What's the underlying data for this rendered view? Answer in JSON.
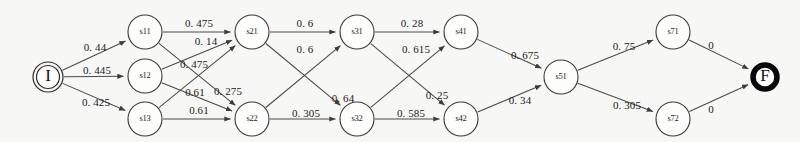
{
  "diagram": {
    "background_color": "#f7f7f5",
    "stroke_color": "#4a4a4a",
    "start_node": {
      "id": "I",
      "label": "I",
      "x": 48,
      "y": 77,
      "r": 15
    },
    "final_node": {
      "id": "F",
      "label": "F",
      "x": 765,
      "y": 77,
      "r": 14
    },
    "nodes": [
      {
        "id": "s11",
        "label": "s11",
        "x": 145,
        "y": 32,
        "r": 17
      },
      {
        "id": "s12",
        "label": "s12",
        "x": 145,
        "y": 76,
        "r": 17
      },
      {
        "id": "s13",
        "label": "s13",
        "x": 145,
        "y": 119,
        "r": 17
      },
      {
        "id": "s21",
        "label": "s21",
        "x": 252,
        "y": 32,
        "r": 17
      },
      {
        "id": "s22",
        "label": "s22",
        "x": 252,
        "y": 119,
        "r": 17
      },
      {
        "id": "s31",
        "label": "s31",
        "x": 357,
        "y": 32,
        "r": 17
      },
      {
        "id": "s32",
        "label": "s32",
        "x": 357,
        "y": 119,
        "r": 17
      },
      {
        "id": "s41",
        "label": "s41",
        "x": 461,
        "y": 32,
        "r": 17
      },
      {
        "id": "s42",
        "label": "s42",
        "x": 461,
        "y": 119,
        "r": 17
      },
      {
        "id": "s51",
        "label": "s51",
        "x": 561,
        "y": 77,
        "r": 17
      },
      {
        "id": "s71",
        "label": "s71",
        "x": 673,
        "y": 32,
        "r": 17
      },
      {
        "id": "s72",
        "label": "s72",
        "x": 673,
        "y": 119,
        "r": 17
      }
    ],
    "edges": [
      {
        "from": "I",
        "to": "s11",
        "weight": "0. 44",
        "lx": 95,
        "ly": 48
      },
      {
        "from": "I",
        "to": "s12",
        "weight": "0. 445",
        "lx": 97,
        "ly": 71
      },
      {
        "from": "I",
        "to": "s13",
        "weight": "0. 425",
        "lx": 96,
        "ly": 103
      },
      {
        "from": "s11",
        "to": "s21",
        "weight": "0. 475",
        "lx": 199,
        "ly": 24
      },
      {
        "from": "s11",
        "to": "s22",
        "weight": "0. 475",
        "lx": 194,
        "ly": 65
      },
      {
        "from": "s12",
        "to": "s21",
        "weight": "0. 14",
        "lx": 206,
        "ly": 42
      },
      {
        "from": "s12",
        "to": "s22",
        "weight": "0.61",
        "lx": 195,
        "ly": 93
      },
      {
        "from": "s13",
        "to": "s21",
        "weight": "0. 275",
        "lx": 228,
        "ly": 92
      },
      {
        "from": "s13",
        "to": "s22",
        "weight": "0.61",
        "lx": 199,
        "ly": 111
      },
      {
        "from": "s21",
        "to": "s31",
        "weight": "0. 6",
        "lx": 305,
        "ly": 24
      },
      {
        "from": "s21",
        "to": "s32",
        "weight": "0. 64",
        "lx": 343,
        "ly": 99
      },
      {
        "from": "s22",
        "to": "s31",
        "weight": "0. 6",
        "lx": 305,
        "ly": 50
      },
      {
        "from": "s22",
        "to": "s32",
        "weight": "0. 305",
        "lx": 306,
        "ly": 114
      },
      {
        "from": "s31",
        "to": "s41",
        "weight": "0. 28",
        "lx": 412,
        "ly": 24
      },
      {
        "from": "s31",
        "to": "s42",
        "weight": "0. 25",
        "lx": 437,
        "ly": 96
      },
      {
        "from": "s32",
        "to": "s41",
        "weight": "0. 615",
        "lx": 416,
        "ly": 50
      },
      {
        "from": "s32",
        "to": "s42",
        "weight": "0. 585",
        "lx": 411,
        "ly": 114
      },
      {
        "from": "s41",
        "to": "s51",
        "weight": "0. 675",
        "lx": 525,
        "ly": 56
      },
      {
        "from": "s42",
        "to": "s51",
        "weight": "0. 34",
        "lx": 520,
        "ly": 101
      },
      {
        "from": "s51",
        "to": "s71",
        "weight": "0. 75",
        "lx": 624,
        "ly": 47
      },
      {
        "from": "s51",
        "to": "s72",
        "weight": "0. 305",
        "lx": 627,
        "ly": 106
      },
      {
        "from": "s71",
        "to": "F",
        "weight": "0",
        "lx": 711,
        "ly": 46
      },
      {
        "from": "s72",
        "to": "F",
        "weight": "0",
        "lx": 711,
        "ly": 110
      }
    ]
  }
}
